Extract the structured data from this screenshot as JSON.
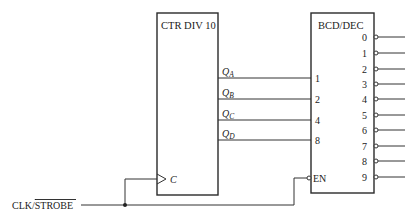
{
  "counter": {
    "title": "CTR DIV 10",
    "clock_label": "C",
    "outputs": [
      {
        "main": "Q",
        "sub": "A",
        "y": 78
      },
      {
        "main": "Q",
        "sub": "B",
        "y": 99
      },
      {
        "main": "Q",
        "sub": "C",
        "y": 120
      },
      {
        "main": "Q",
        "sub": "D",
        "y": 140
      }
    ]
  },
  "decoder": {
    "title": "BCD/DEC",
    "inputs": [
      "1",
      "2",
      "4",
      "8"
    ],
    "enable_label": "EN",
    "outputs": [
      "0",
      "1",
      "2",
      "3",
      "4",
      "5",
      "6",
      "7",
      "8",
      "9"
    ]
  },
  "signal": {
    "clk": "CLK/",
    "strobe": "STROBE"
  },
  "colors": {
    "line": "#333333",
    "background": "#ffffff"
  }
}
